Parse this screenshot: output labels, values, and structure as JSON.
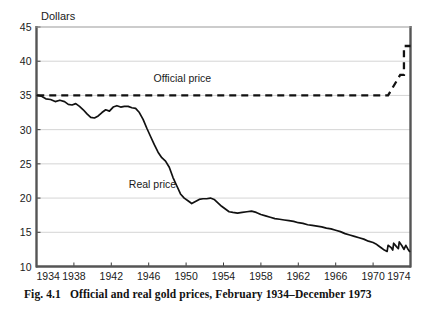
{
  "figure": {
    "caption_number": "Fig. 4.1",
    "caption_text": "Official and real gold prices, February 1934–December 1973"
  },
  "chart_data": {
    "type": "line",
    "title": "",
    "subtitle": "",
    "xlabel": "",
    "ylabel": "Dollars",
    "xlim": [
      1934,
      1974
    ],
    "ylim": [
      10,
      45
    ],
    "yticks": [
      10,
      15,
      20,
      25,
      30,
      35,
      40,
      45
    ],
    "xticks": [
      1934,
      1938,
      1942,
      1946,
      1950,
      1954,
      1958,
      1962,
      1966,
      1970,
      1974
    ],
    "grid": "horizontal",
    "legend": "inline-annotations",
    "annotations": [
      {
        "text": "Official price",
        "x": 1949.6,
        "y": 36.9
      },
      {
        "text": "Real price",
        "x": 1946.4,
        "y": 21.4
      }
    ],
    "series": [
      {
        "name": "Official price",
        "style": "dashed",
        "color": "#111111",
        "x": [
          1934.08,
          1971.6,
          1971.6,
          1972.9,
          1972.9,
          1973.3,
          1973.3,
          1974.0
        ],
        "values": [
          35.0,
          35.0,
          35.0,
          38.0,
          38.0,
          38.0,
          42.22,
          42.22
        ]
      },
      {
        "name": "Real price",
        "style": "solid",
        "color": "#111111",
        "x": [
          1934.08,
          1934.5,
          1935.0,
          1935.5,
          1936.0,
          1936.5,
          1937.0,
          1937.4,
          1937.8,
          1938.2,
          1938.6,
          1939.0,
          1939.4,
          1939.8,
          1940.2,
          1940.6,
          1941.0,
          1941.4,
          1941.8,
          1942.2,
          1942.6,
          1943.0,
          1943.4,
          1943.8,
          1944.2,
          1944.6,
          1945.0,
          1945.4,
          1945.8,
          1946.2,
          1946.6,
          1947.0,
          1947.4,
          1947.8,
          1948.2,
          1948.6,
          1949.0,
          1949.4,
          1949.8,
          1950.2,
          1950.6,
          1951.0,
          1951.4,
          1951.8,
          1952.2,
          1952.6,
          1953.0,
          1953.4,
          1953.8,
          1954.2,
          1954.6,
          1955.0,
          1955.5,
          1956.0,
          1956.5,
          1957.0,
          1957.5,
          1958.0,
          1958.5,
          1959.0,
          1959.5,
          1960.0,
          1960.5,
          1961.0,
          1961.5,
          1962.0,
          1962.5,
          1963.0,
          1963.5,
          1964.0,
          1964.5,
          1965.0,
          1965.5,
          1966.0,
          1966.5,
          1967.0,
          1967.5,
          1968.0,
          1968.5,
          1969.0,
          1969.5,
          1970.0,
          1970.3,
          1970.6,
          1970.9,
          1971.2,
          1971.5,
          1971.6,
          1971.9,
          1972.1,
          1972.2,
          1972.5,
          1972.7,
          1972.8,
          1973.1,
          1973.3,
          1973.5,
          1973.7,
          1973.9
        ],
        "values": [
          35.0,
          34.9,
          34.5,
          34.4,
          34.1,
          34.3,
          34.1,
          33.7,
          33.6,
          33.8,
          33.4,
          32.9,
          32.3,
          31.8,
          31.7,
          32.0,
          32.5,
          32.9,
          32.7,
          33.3,
          33.5,
          33.3,
          33.4,
          33.4,
          33.2,
          33.1,
          32.5,
          31.5,
          30.2,
          29.0,
          27.8,
          26.7,
          25.9,
          25.4,
          24.5,
          23.0,
          21.8,
          20.6,
          20.0,
          19.6,
          19.2,
          19.5,
          19.8,
          19.9,
          19.9,
          20.0,
          19.8,
          19.3,
          18.8,
          18.4,
          18.0,
          17.9,
          17.8,
          17.9,
          18.0,
          18.1,
          17.9,
          17.6,
          17.4,
          17.2,
          17.0,
          16.9,
          16.8,
          16.7,
          16.6,
          16.4,
          16.3,
          16.1,
          16.0,
          15.9,
          15.8,
          15.6,
          15.5,
          15.3,
          15.1,
          14.8,
          14.6,
          14.4,
          14.2,
          14.0,
          13.7,
          13.5,
          13.3,
          13.0,
          12.7,
          12.4,
          12.2,
          13.1,
          12.8,
          12.4,
          13.4,
          12.9,
          12.6,
          13.6,
          13.0,
          12.5,
          13.1,
          12.6,
          12.2
        ]
      }
    ]
  }
}
